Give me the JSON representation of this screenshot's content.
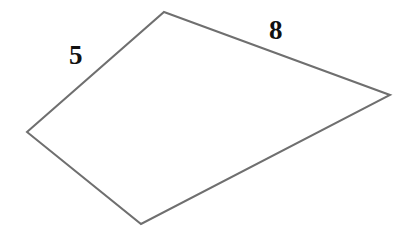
{
  "figure": {
    "background_color": "#ffffff",
    "stroke_color": "#6f6f6f",
    "stroke_width": 2,
    "label_color": "#111111",
    "width": 408,
    "height": 231,
    "vertices": [
      {
        "name": "top",
        "x": 164,
        "y": 12
      },
      {
        "name": "right",
        "x": 390,
        "y": 95
      },
      {
        "name": "bottom",
        "x": 141,
        "y": 224
      },
      {
        "name": "left",
        "x": 27,
        "y": 132
      }
    ],
    "edges": [
      {
        "name": "top-right-edge",
        "from": "top",
        "to": "right",
        "label": "8"
      },
      {
        "name": "bottom-right-edge",
        "from": "right",
        "to": "bottom",
        "label": ""
      },
      {
        "name": "bottom-left-edge",
        "from": "bottom",
        "to": "left",
        "label": ""
      },
      {
        "name": "top-left-edge",
        "from": "left",
        "to": "top",
        "label": "5"
      }
    ],
    "labels": {
      "left_side": "5",
      "top_right_side": "8"
    }
  }
}
